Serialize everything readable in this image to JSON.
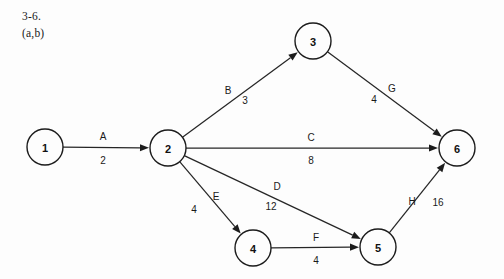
{
  "caption": {
    "line1": "3-6.",
    "line2": "(a,b)"
  },
  "diagram": {
    "type": "directed-network-activity-on-arc",
    "colors": {
      "background": "#fdfdfd",
      "stroke": "#1c1c1c",
      "text": "#111111"
    },
    "nodes": [
      {
        "id": "1",
        "label": "1",
        "cx": 45,
        "cy": 147,
        "r": 18
      },
      {
        "id": "2",
        "label": "2",
        "cx": 168,
        "cy": 148,
        "r": 18
      },
      {
        "id": "3",
        "label": "3",
        "cx": 313,
        "cy": 41,
        "r": 18
      },
      {
        "id": "4",
        "label": "4",
        "cx": 253,
        "cy": 248,
        "r": 18
      },
      {
        "id": "5",
        "label": "5",
        "cx": 378,
        "cy": 247,
        "r": 18
      },
      {
        "id": "6",
        "label": "6",
        "cx": 457,
        "cy": 148,
        "r": 18
      }
    ],
    "edges": [
      {
        "id": "A",
        "name": "A",
        "cost": "2",
        "from": "1",
        "to": "2",
        "name_x": 103,
        "name_y": 136,
        "cost_x": 103,
        "cost_y": 160
      },
      {
        "id": "B",
        "name": "B",
        "cost": "3",
        "from": "2",
        "to": "3",
        "name_x": 228,
        "name_y": 90,
        "cost_x": 245,
        "cost_y": 100
      },
      {
        "id": "C",
        "name": "C",
        "cost": "8",
        "from": "2",
        "to": "6",
        "name_x": 311,
        "name_y": 137,
        "cost_x": 311,
        "cost_y": 160
      },
      {
        "id": "D",
        "name": "D",
        "cost": "12",
        "from": "2",
        "to": "5",
        "name_x": 277,
        "name_y": 186,
        "cost_x": 271,
        "cost_y": 206
      },
      {
        "id": "E",
        "name": "E",
        "cost": "4",
        "from": "2",
        "to": "4",
        "name_x": 216,
        "name_y": 196,
        "cost_x": 194,
        "cost_y": 209
      },
      {
        "id": "F",
        "name": "F",
        "cost": "4",
        "from": "4",
        "to": "5",
        "name_x": 316,
        "name_y": 237,
        "cost_x": 316,
        "cost_y": 260
      },
      {
        "id": "G",
        "name": "G",
        "cost": "4",
        "from": "3",
        "to": "6",
        "name_x": 392,
        "name_y": 88,
        "cost_x": 374,
        "cost_y": 99
      },
      {
        "id": "H",
        "name": "H",
        "cost": "16",
        "from": "5",
        "to": "6",
        "name_x": 412,
        "name_y": 201,
        "cost_x": 438,
        "cost_y": 202
      }
    ]
  }
}
